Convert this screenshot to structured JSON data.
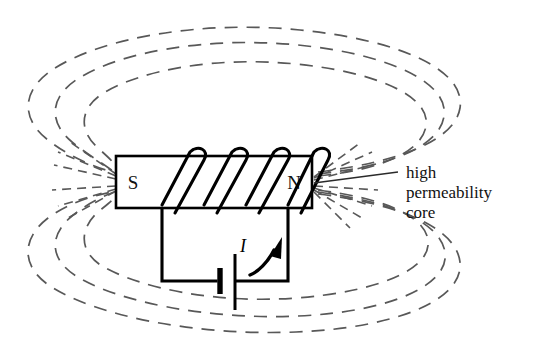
{
  "figure": {
    "background_color": "#ffffff",
    "width": 544,
    "height": 354
  },
  "core": {
    "south_pole_label": "S",
    "north_pole_label": "N",
    "stroke_color": "#000000",
    "fill_color": "#ffffff"
  },
  "coil": {
    "turn_count": 4,
    "stroke_color": "#000000"
  },
  "circuit": {
    "current_label": "I",
    "battery_symbol": "battery-cell",
    "wire_color": "#000000"
  },
  "annotation": {
    "line1": "high",
    "line2": "permeability",
    "line3": "core",
    "text_color": "#111111"
  },
  "field": {
    "line_color": "#585858",
    "style": "dashed",
    "upper_arc_count": 3,
    "lower_arc_count": 3,
    "description": "magnetic field lines"
  }
}
